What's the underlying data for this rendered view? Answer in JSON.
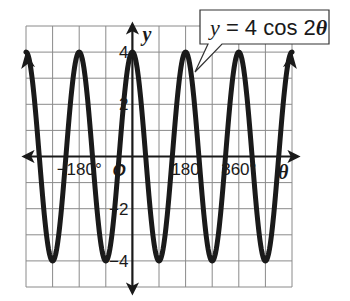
{
  "chart_data": {
    "type": "line",
    "title": "",
    "equation_label": {
      "y_part": "y",
      "eq_part": " = 4 cos 2",
      "theta_part": "θ",
      "full": "y = 4 cos 2θ"
    },
    "xlabel": "θ",
    "ylabel": "y",
    "x_unit": "degrees",
    "xlim": [
      -360,
      540
    ],
    "ylim": [
      -5,
      5
    ],
    "grid": true,
    "x_grid_step": 90,
    "y_grid_step": 1,
    "x_tick_labels": [
      {
        "value": -180,
        "label": "−180°"
      },
      {
        "value": 0,
        "label": "O"
      },
      {
        "value": 180,
        "label": "180"
      },
      {
        "value": 360,
        "label": "360°"
      }
    ],
    "y_tick_labels": [
      {
        "value": 4,
        "label": "4"
      },
      {
        "value": 2,
        "label": "2"
      },
      {
        "value": -2,
        "label": "−2"
      },
      {
        "value": -4,
        "label": "−4"
      }
    ],
    "series": [
      {
        "name": "y = 4 cos 2θ",
        "function": "4*cos(2*theta)",
        "amplitude": 4,
        "period_degrees": 180,
        "x": [
          -360,
          -270,
          -180,
          -90,
          0,
          90,
          180,
          270,
          360,
          450,
          540
        ],
        "values": [
          4,
          -4,
          4,
          -4,
          4,
          -4,
          4,
          -4,
          4,
          -4,
          4
        ],
        "arrows_at_ends": true
      }
    ],
    "legend": "callout box top-right pointing to curve"
  },
  "colors": {
    "curve": "#1a1a1a",
    "grid": "#8a8a8a",
    "background": "#ffffff"
  }
}
